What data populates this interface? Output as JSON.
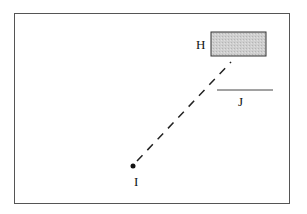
{
  "diagram": {
    "labels": {
      "H": "H",
      "I": "I",
      "J": "J"
    },
    "elements": {
      "rect_H": {
        "x": 211,
        "y": 32,
        "width": 55,
        "height": 24,
        "fill": "#c8c8c8",
        "stroke": "#333333"
      },
      "point_I": {
        "cx": 133,
        "cy": 166,
        "r": 2.5,
        "fill": "#111111"
      },
      "line_J": {
        "x1": 217,
        "y1": 90,
        "x2": 273,
        "y2": 90,
        "stroke": "#444444"
      },
      "dashed_I_to_H": {
        "x1": 137,
        "y1": 161,
        "x2": 231,
        "y2": 62,
        "stroke": "#222222",
        "dash": "8,7"
      }
    },
    "colors": {
      "frame": "#555555",
      "background": "#ffffff"
    }
  }
}
